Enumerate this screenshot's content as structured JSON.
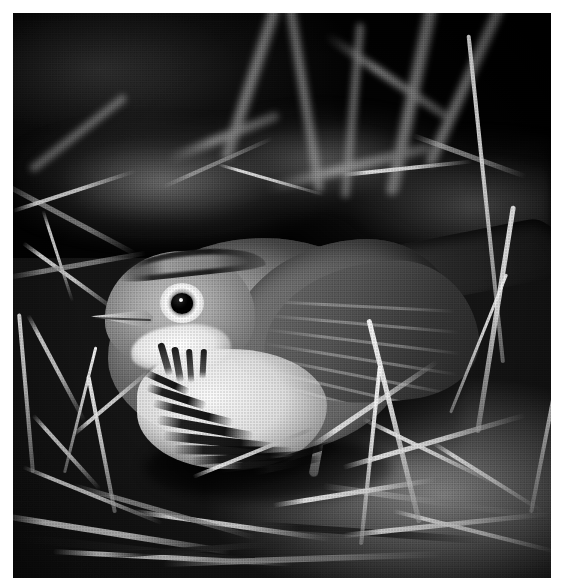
{
  "document": {
    "type": "photograph",
    "title": "Ovenbird on forest floor",
    "medium": "black-and-white halftone print",
    "orientation": "portrait",
    "border_color": "#ffffff",
    "background_color": "#ffffff"
  },
  "photo": {
    "name": "ovenbird-photo",
    "alt_text": "Grainy black-and-white photograph of an Ovenbird standing on leaf litter and straw, facing left, with a dark eye ringed in white, a pale pointed bill, a white throat and heavily dark-streaked white breast, plain grey-brown upperparts and a long tail sweeping to the upper right.",
    "frame": {
      "x": 13,
      "y": 13,
      "width": 538,
      "height": 565
    },
    "tones": {
      "deep_shadow": "#070707",
      "shadow": "#1a1a1a",
      "midtone": "#5a5a5a",
      "light_midtone": "#9a9a9a",
      "highlight": "#e8e8e8",
      "paper_white": "#fcfcfc"
    }
  },
  "subject": {
    "common_name": "Ovenbird",
    "label": "bird",
    "pose": "standing, facing left",
    "parts": [
      {
        "name": "crown-stripe",
        "label": "lateral crown stripe",
        "tone": "dark"
      },
      {
        "name": "eye",
        "label": "eye",
        "tone": "black"
      },
      {
        "name": "eye-ring",
        "label": "white eye-ring",
        "tone": "white"
      },
      {
        "name": "bill",
        "label": "bill",
        "tone": "pale grey"
      },
      {
        "name": "throat",
        "label": "white throat",
        "tone": "white"
      },
      {
        "name": "malar-streak",
        "label": "malar streaks",
        "tone": "dark"
      },
      {
        "name": "breast",
        "label": "streaked breast",
        "tone": "white with dark streaks"
      },
      {
        "name": "mantle",
        "label": "mantle and back",
        "tone": "grey-brown"
      },
      {
        "name": "wing",
        "label": "folded wing",
        "tone": "dark grey"
      },
      {
        "name": "tail",
        "label": "tail",
        "tone": "dark"
      },
      {
        "name": "leg",
        "label": "leg",
        "tone": "pale"
      }
    ]
  },
  "scene": {
    "setting": "forest floor",
    "elements": [
      {
        "name": "background-vegetation",
        "label": "dark out-of-focus stems and leaves"
      },
      {
        "name": "leaf-litter",
        "label": "dry leaf litter and soil"
      },
      {
        "name": "straw-mat",
        "label": "scattered pale straw and twigs"
      },
      {
        "name": "foreground-grass",
        "label": "bright vertical grass blades"
      }
    ]
  }
}
